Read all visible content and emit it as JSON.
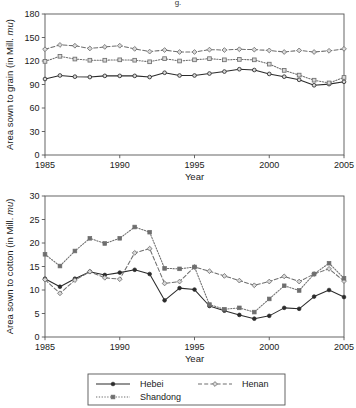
{
  "figure": {
    "cropped_header_fragment": "g.",
    "background_color": "#ffffff",
    "line_color": "#555555"
  },
  "legend": {
    "position": "bottom-center",
    "entries": [
      {
        "label": "Hebei",
        "marker": "filled-circle",
        "dash": "solid",
        "color": "#2b2b2b"
      },
      {
        "label": "Henan",
        "marker": "open-diamond",
        "dash": "dashed",
        "color": "#6e6e6e"
      },
      {
        "label": "Shandong",
        "marker": "filled-square",
        "dash": "dotted",
        "color": "#6e6e6e"
      }
    ]
  },
  "chart_data": [
    {
      "id": "grain",
      "type": "line",
      "title": "",
      "xlabel": "Year",
      "ylabel": "Area sown to grain (in Mill. mu)",
      "ylabel_plain": "Area sown to grain (in Mill. ",
      "ylabel_italic": "mu",
      "ylabel_tail": ")",
      "xlim": [
        1985,
        2005
      ],
      "ylim": [
        0,
        180
      ],
      "xticks": [
        1985,
        1990,
        1995,
        2000,
        2005
      ],
      "yticks": [
        0,
        30,
        60,
        90,
        120,
        150,
        180
      ],
      "grid": false,
      "x": [
        1985,
        1986,
        1987,
        1988,
        1989,
        1990,
        1991,
        1992,
        1993,
        1994,
        1995,
        1996,
        1997,
        1998,
        1999,
        2000,
        2001,
        2002,
        2003,
        2004,
        2005
      ],
      "series": [
        {
          "name": "Hebei",
          "marker": "open-circle",
          "dash": "solid",
          "color": "#2b2b2b",
          "values": [
            97,
            101.5,
            100,
            99.5,
            101,
            101,
            101,
            99.5,
            105,
            101.5,
            101.5,
            104,
            106.5,
            109.5,
            108.5,
            103.5,
            100,
            96,
            89,
            90.5,
            93.5
          ]
        },
        {
          "name": "Henan",
          "marker": "open-diamond",
          "dash": "dashed",
          "color": "#6e6e6e",
          "values": [
            135,
            140.5,
            139.5,
            136,
            138,
            139.5,
            135.5,
            132,
            134,
            131.5,
            131.5,
            134.5,
            134,
            135,
            134.5,
            133.5,
            131.5,
            133.5,
            131.5,
            133,
            135.5
          ]
        },
        {
          "name": "Shandong",
          "marker": "open-square",
          "dash": "dotted",
          "color": "#6e6e6e",
          "values": [
            119.5,
            126,
            122.5,
            121,
            121,
            121.5,
            121,
            119,
            123,
            120,
            121.5,
            123,
            121.5,
            122,
            121.5,
            116,
            108,
            102,
            95.5,
            92,
            99
          ]
        }
      ]
    },
    {
      "id": "cotton",
      "type": "line",
      "title": "",
      "xlabel": "Year",
      "ylabel": "Area sown to cotton (in Mill. mu)",
      "ylabel_plain": "Area sown to cotton (in Mill. ",
      "ylabel_italic": "mu",
      "ylabel_tail": ")",
      "xlim": [
        1985,
        2005
      ],
      "ylim": [
        0,
        30
      ],
      "xticks": [
        1985,
        1990,
        1995,
        2000,
        2005
      ],
      "yticks": [
        0,
        5,
        10,
        15,
        20,
        25,
        30
      ],
      "grid": false,
      "x": [
        1985,
        1986,
        1987,
        1988,
        1989,
        1990,
        1991,
        1992,
        1993,
        1994,
        1995,
        1996,
        1997,
        1998,
        1999,
        2000,
        2001,
        2002,
        2003,
        2004,
        2005
      ],
      "series": [
        {
          "name": "Hebei",
          "marker": "filled-circle",
          "dash": "solid",
          "color": "#2b2b2b",
          "values": [
            12.4,
            10.7,
            12.4,
            13.9,
            13.2,
            13.7,
            14.3,
            13.4,
            7.8,
            10.4,
            10.1,
            6.6,
            5.6,
            4.7,
            3.9,
            4.5,
            6.2,
            6.0,
            8.6,
            10.0,
            8.5
          ]
        },
        {
          "name": "Henan",
          "marker": "open-diamond",
          "dash": "dashed",
          "color": "#6e6e6e",
          "values": [
            12.2,
            9.3,
            12.1,
            13.9,
            12.6,
            12.3,
            17.9,
            18.8,
            11.4,
            11.8,
            14.9,
            14.0,
            13.0,
            12.0,
            11.0,
            11.8,
            12.9,
            11.8,
            13.4,
            14.5,
            11.9
          ]
        },
        {
          "name": "Shandong",
          "marker": "filled-square",
          "dash": "dotted",
          "color": "#6e6e6e",
          "values": [
            17.6,
            15.1,
            18.3,
            21.0,
            19.9,
            21.0,
            23.4,
            22.3,
            14.6,
            14.5,
            14.9,
            6.9,
            5.9,
            6.2,
            5.3,
            8.1,
            10.9,
            9.9,
            13.4,
            15.7,
            12.5
          ]
        }
      ]
    }
  ]
}
